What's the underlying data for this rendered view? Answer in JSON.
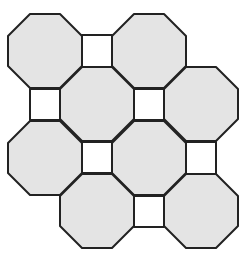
{
  "diagram": {
    "title": "Truncated square tiling (octagons and squares)",
    "colors": {
      "background": "#ffffff",
      "octagon_fill": "#e4e4e4",
      "square_fill": "#ffffff",
      "stroke": "#222222"
    },
    "stroke_width": 2,
    "octagon": {
      "width": 74,
      "chamfer": 22
    },
    "octagons": [
      {
        "id": "oct-r1-c1",
        "cx": 45,
        "cy": 51
      },
      {
        "id": "oct-r1-c2",
        "cx": 149,
        "cy": 51
      },
      {
        "id": "oct-r2-c1",
        "cx": 97,
        "cy": 104
      },
      {
        "id": "oct-r2-c2",
        "cx": 201,
        "cy": 104
      },
      {
        "id": "oct-r3-c1",
        "cx": 45,
        "cy": 158
      },
      {
        "id": "oct-r3-c2",
        "cx": 149,
        "cy": 158
      },
      {
        "id": "oct-r4-c1",
        "cx": 97,
        "cy": 211
      },
      {
        "id": "oct-r4-c2",
        "cx": 201,
        "cy": 211
      }
    ],
    "squares": [
      {
        "id": "sq-1",
        "x": 82,
        "y": 35,
        "w": 30,
        "h": 32
      },
      {
        "id": "sq-2",
        "x": 30,
        "y": 89,
        "w": 30,
        "h": 31
      },
      {
        "id": "sq-3",
        "x": 134,
        "y": 89,
        "w": 30,
        "h": 31
      },
      {
        "id": "sq-4",
        "x": 82,
        "y": 142,
        "w": 30,
        "h": 31
      },
      {
        "id": "sq-5",
        "x": 186,
        "y": 142,
        "w": 30,
        "h": 32
      },
      {
        "id": "sq-6",
        "x": 134,
        "y": 196,
        "w": 30,
        "h": 31
      }
    ]
  }
}
